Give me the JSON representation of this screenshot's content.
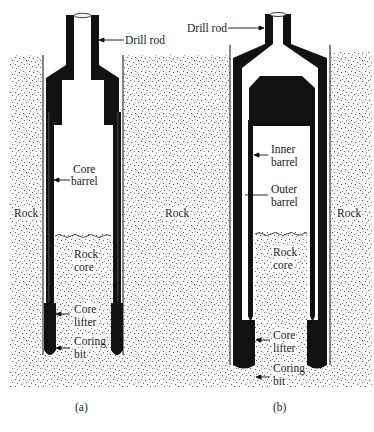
{
  "figure": {
    "panels": [
      {
        "id": "a",
        "caption": "(a)",
        "type": "single-tube core barrel",
        "labels": {
          "drill_rod": "Drill rod",
          "core_barrel_1": "Core",
          "core_barrel_2": "barrel",
          "rock_left": "Rock",
          "rock_right": "Rock",
          "rock_core_1": "Rock",
          "rock_core_2": "core",
          "core_lifter_1": "Core",
          "core_lifter_2": "lifter",
          "coring_bit_1": "Coring",
          "coring_bit_2": "bit"
        }
      },
      {
        "id": "b",
        "caption": "(b)",
        "type": "double-tube core barrel",
        "labels": {
          "drill_rod": "Drill rod",
          "inner_barrel_1": "Inner",
          "inner_barrel_2": "barrel",
          "outer_barrel_1": "Outer",
          "outer_barrel_2": "barrel",
          "rock_right": "Rock",
          "rock_core_1": "Rock",
          "rock_core_2": "core",
          "core_lifter_1": "Core",
          "core_lifter_2": "lifter",
          "coring_bit_1": "Coring",
          "coring_bit_2": "bit"
        }
      }
    ],
    "colors": {
      "steel": "#111111",
      "rock_speckle": "#3a3a3a",
      "background": "#ffffff"
    }
  }
}
